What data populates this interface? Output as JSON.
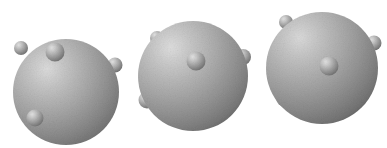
{
  "figure": {
    "width": 387,
    "height": 148,
    "background_color": "#ffffff",
    "caption": ""
  },
  "palette": {
    "background": "#ffffff",
    "sphere_highlight": "#d8d8d8",
    "sphere_midtone": "#a8a8a8",
    "sphere_shadow": "#6f6f6f",
    "sphere_edge": "#5e5e5e",
    "satellite_highlight": "#dedede",
    "satellite_midtone": "#9e9e9e",
    "satellite_shadow": "#646464",
    "noise_color": "#8c8c8c"
  },
  "models": [
    {
      "name": "model-left",
      "label": "Sphere model 1",
      "main_sphere": {
        "name": "main-sphere-1",
        "cx": 66,
        "cy": 92,
        "r": 53,
        "highlight_x": 42,
        "highlight_y": 58
      },
      "satellites": [
        {
          "name": "satellite-1-top-left",
          "cx": 21,
          "cy": 48,
          "r": 7,
          "highlight_x": 18,
          "highlight_y": 44
        },
        {
          "name": "satellite-1-top-center",
          "cx": 55,
          "cy": 52,
          "r": 9.5,
          "highlight_x": 51,
          "highlight_y": 47
        },
        {
          "name": "satellite-1-right",
          "cx": 115,
          "cy": 65,
          "r": 7.5,
          "highlight_x": 112,
          "highlight_y": 61
        },
        {
          "name": "satellite-1-bottom-left",
          "cx": 35,
          "cy": 118,
          "r": 8.5,
          "highlight_x": 31,
          "highlight_y": 113
        }
      ]
    },
    {
      "name": "model-center",
      "label": "Sphere model 2",
      "main_sphere": {
        "name": "main-sphere-2",
        "cx": 193,
        "cy": 76,
        "r": 55,
        "highlight_x": 168,
        "highlight_y": 42
      },
      "satellites": [
        {
          "name": "satellite-2-top-left",
          "cx": 157,
          "cy": 38,
          "r": 7,
          "highlight_x": 154,
          "highlight_y": 34
        },
        {
          "name": "satellite-2-center",
          "cx": 196,
          "cy": 61,
          "r": 9.5,
          "highlight_x": 192,
          "highlight_y": 56
        },
        {
          "name": "satellite-2-right",
          "cx": 243,
          "cy": 57,
          "r": 8,
          "highlight_x": 240,
          "highlight_y": 53
        },
        {
          "name": "satellite-2-lower-left",
          "cx": 147,
          "cy": 100,
          "r": 8.5,
          "highlight_x": 143,
          "highlight_y": 95
        }
      ]
    },
    {
      "name": "model-right",
      "label": "Sphere model 3",
      "main_sphere": {
        "name": "main-sphere-3",
        "cx": 322,
        "cy": 68,
        "r": 56,
        "highlight_x": 296,
        "highlight_y": 33
      },
      "satellites": [
        {
          "name": "satellite-3-top-left",
          "cx": 286,
          "cy": 22,
          "r": 7,
          "highlight_x": 283,
          "highlight_y": 18
        },
        {
          "name": "satellite-3-center",
          "cx": 329,
          "cy": 66,
          "r": 9.5,
          "highlight_x": 325,
          "highlight_y": 61
        },
        {
          "name": "satellite-3-right",
          "cx": 374,
          "cy": 43,
          "r": 7.5,
          "highlight_x": 371,
          "highlight_y": 39
        },
        {
          "name": "satellite-3-lower-left",
          "cx": 285,
          "cy": 98,
          "r": 9,
          "highlight_x": 281,
          "highlight_y": 93
        }
      ]
    }
  ]
}
